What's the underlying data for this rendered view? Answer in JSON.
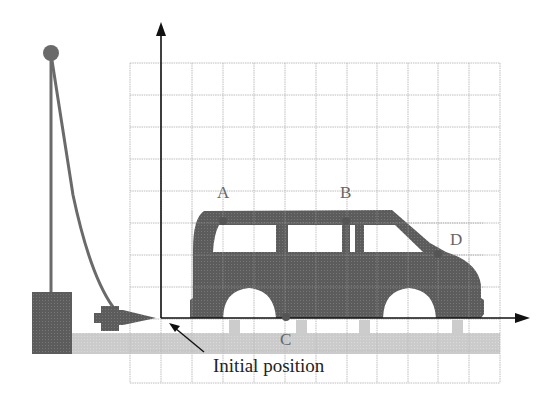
{
  "diagram": {
    "points": [
      {
        "id": "A",
        "label": "A",
        "x": 223,
        "y": 221,
        "label_x": 218,
        "label_y": 198
      },
      {
        "id": "B",
        "label": "B",
        "x": 346,
        "y": 221,
        "label_x": 340,
        "label_y": 198
      },
      {
        "id": "C",
        "label": "C",
        "x": 286,
        "y": 317,
        "label_x": 280,
        "label_y": 345
      },
      {
        "id": "D",
        "label": "D",
        "x": 438,
        "y": 254,
        "label_x": 450,
        "label_y": 245
      }
    ],
    "caption": "Initial position",
    "colors": {
      "car": "#5f5f5f",
      "ground": "#c8c8c8",
      "grid": "#bdbdbd",
      "axis": "#111111",
      "apparatus": "#6a6a6a",
      "point": "#555555"
    },
    "grid": {
      "x0": 130,
      "x1": 500,
      "y0": 63,
      "y1": 383,
      "cols": 12,
      "rows": 10
    }
  }
}
